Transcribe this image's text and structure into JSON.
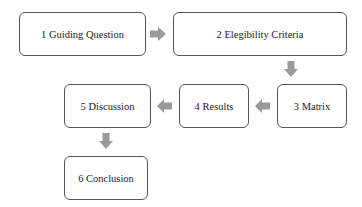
{
  "diagram": {
    "type": "flowchart",
    "arrow_color": "#9a9a9a",
    "border_color": "#555555",
    "steps": [
      {
        "id": 1,
        "label": "1 Guiding Question"
      },
      {
        "id": 2,
        "label": "2 Elegibility  Criteria"
      },
      {
        "id": 3,
        "label": "3 Matrix"
      },
      {
        "id": 4,
        "label": "4 Results"
      },
      {
        "id": 5,
        "label": "5 Discussion"
      },
      {
        "id": 6,
        "label": "6 Conclusion"
      }
    ],
    "connections": [
      {
        "from": 1,
        "to": 2,
        "direction": "right"
      },
      {
        "from": 2,
        "to": 3,
        "direction": "down"
      },
      {
        "from": 3,
        "to": 4,
        "direction": "left"
      },
      {
        "from": 4,
        "to": 5,
        "direction": "left"
      },
      {
        "from": 5,
        "to": 6,
        "direction": "down"
      }
    ]
  }
}
